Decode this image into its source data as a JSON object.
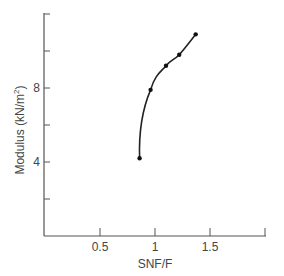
{
  "chart_data": {
    "type": "line",
    "title": "",
    "xlabel": "SNF/F",
    "ylabel": "Modulus (kN/m²)",
    "ylabel_main": "Modulus (kN/m",
    "ylabel_sup": "2",
    "ylabel_end": ")",
    "xlim": [
      0,
      2.0
    ],
    "ylim": [
      0,
      12
    ],
    "x_ticks": [
      0.5,
      1,
      1.5,
      2.0
    ],
    "x_tick_labels": [
      "0.5",
      "1",
      "1.5",
      ""
    ],
    "y_ticks": [
      2,
      4,
      6,
      8,
      10,
      12
    ],
    "y_tick_labels": [
      "",
      "4",
      "",
      "8",
      "",
      ""
    ],
    "grid": false,
    "legend": null,
    "series": [
      {
        "name": "Modulus vs SNF/F",
        "x": [
          0.86,
          0.96,
          1.1,
          1.22,
          1.37
        ],
        "y": [
          4.2,
          7.9,
          9.2,
          9.8,
          10.9
        ]
      }
    ]
  },
  "colors": {
    "axis": "#555555",
    "curve": "#222222",
    "points": "#111111",
    "background": "#ffffff"
  }
}
